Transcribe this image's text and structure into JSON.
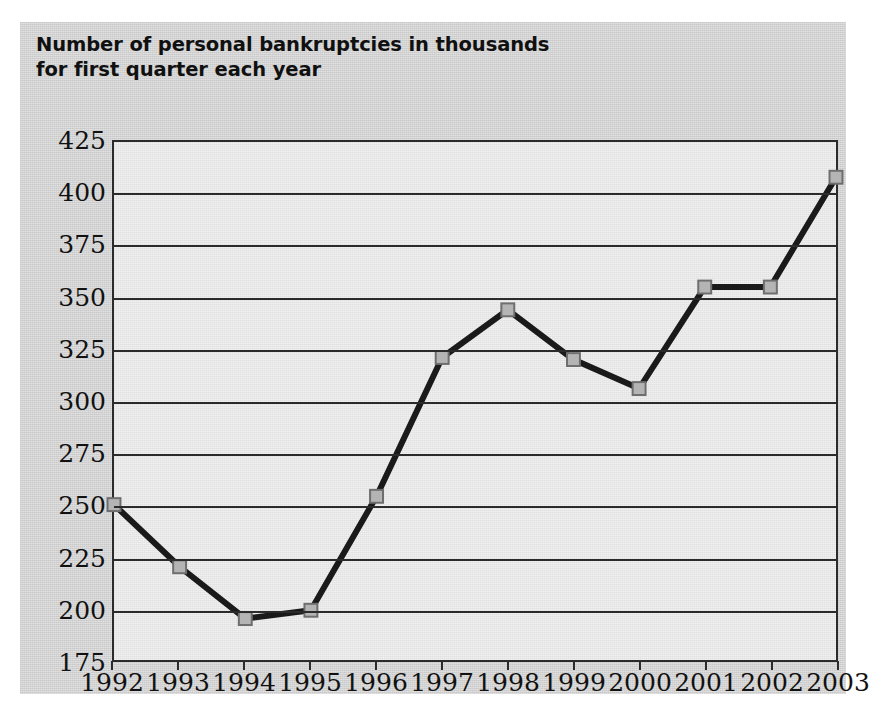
{
  "figure": {
    "title_line1": "Number of personal bankruptcies in thousands",
    "title_line2": "for first quarter each year",
    "card_color": "#d2d2d2",
    "plot_bg_color": "#e8e8e8",
    "line_color": "#1a1a1a",
    "marker_fill_color": "#b4b4b4",
    "marker_border_color": "#6e6e6e"
  },
  "chart_data": {
    "type": "line",
    "title": "Number of personal bankruptcies in thousands for first quarter each year",
    "xlabel": "",
    "ylabel": "",
    "categories": [
      "1992",
      "1993",
      "1994",
      "1995",
      "1996",
      "1997",
      "1998",
      "1999",
      "2000",
      "2001",
      "2002",
      "2003"
    ],
    "values": [
      250,
      220,
      195,
      199,
      254,
      321,
      344,
      320,
      306,
      355,
      355,
      408
    ],
    "ylim": [
      175,
      425
    ],
    "ytick_labels": [
      "425",
      "400",
      "375",
      "350",
      "325",
      "300",
      "275",
      "250",
      "225",
      "200",
      "175"
    ],
    "ytick_values": [
      425,
      400,
      375,
      350,
      325,
      300,
      275,
      250,
      225,
      200,
      175
    ],
    "ystep": 25,
    "grid": true,
    "legend": "none",
    "marker": "square"
  }
}
